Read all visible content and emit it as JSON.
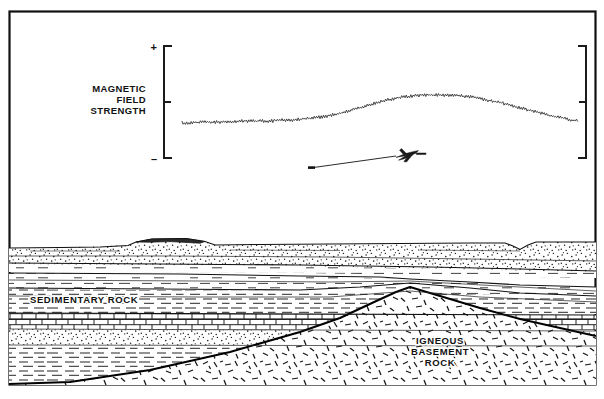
{
  "figure": {
    "kind": "geologic-cross-section-with-magnetic-profile",
    "frame_color": "#111111",
    "ink_color": "#111111",
    "background_color": "#ffffff"
  },
  "profile_panel": {
    "axis_label_lines": [
      "MAGNETIC",
      "FIELD",
      "STRENGTH"
    ],
    "positive_sign": "+",
    "negative_sign": "–",
    "left_bracket_name": "scale-bracket-left",
    "right_bracket_name": "scale-bracket-right"
  },
  "survey": {
    "aircraft_icon": "survey-aircraft-icon",
    "flight_path_label": ""
  },
  "section_labels": {
    "sedimentary": "SEDIMENTARY ROCK",
    "igneous_lines": [
      "IGNEOUS",
      "BASEMENT",
      "ROCK"
    ]
  },
  "chart_data": {
    "type": "line",
    "title": "",
    "xlabel": "",
    "ylabel": "MAGNETIC FIELD STRENGTH",
    "tick_labels": [
      "+",
      "",
      "–"
    ],
    "grid": false,
    "legend": "none",
    "xlim": [
      182,
      578
    ],
    "ylim_pixels": [
      46,
      158
    ],
    "baseline_value": 122,
    "peak_value": 95,
    "series": [
      {
        "name": "total magnetic field",
        "x": [
          182,
          192,
          202,
          212,
          222,
          232,
          242,
          252,
          262,
          272,
          282,
          292,
          302,
          312,
          322,
          332,
          342,
          352,
          362,
          372,
          382,
          392,
          402,
          412,
          422,
          432,
          442,
          452,
          462,
          472,
          482,
          492,
          502,
          512,
          522,
          532,
          542,
          552,
          562,
          572,
          578
        ],
        "values": [
          123,
          123,
          122,
          122,
          122,
          122,
          121,
          121,
          121,
          121,
          120,
          120,
          119,
          118,
          117,
          115,
          113,
          110,
          107,
          104,
          101,
          99,
          97,
          96,
          95,
          95,
          95,
          95,
          96,
          97,
          99,
          101,
          103,
          106,
          108,
          111,
          113,
          116,
          118,
          120,
          121
        ]
      }
    ]
  },
  "strata": {
    "units": [
      {
        "name": "surface-soil-cover",
        "pattern": "stipple"
      },
      {
        "name": "thin-shale-bed",
        "pattern": "dash"
      },
      {
        "name": "sandy-bed",
        "pattern": "dash-sparse"
      },
      {
        "name": "shale-unit-sedimentary",
        "pattern": "dash"
      },
      {
        "name": "limestone-unit",
        "pattern": "brick"
      },
      {
        "name": "sandstone-unit",
        "pattern": "stipple"
      },
      {
        "name": "lower-shale-unit",
        "pattern": "dash"
      },
      {
        "name": "igneous-basement-unit",
        "pattern": "igneous-dashes"
      }
    ]
  }
}
